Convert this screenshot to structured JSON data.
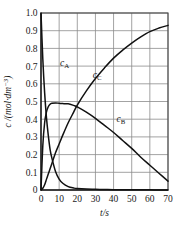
{
  "chart_data": {
    "type": "line",
    "title": "",
    "xlabel": "t/s",
    "ylabel": "c /(mol·dm⁻³)",
    "xlim": [
      0,
      70
    ],
    "ylim": [
      0,
      1.0
    ],
    "grid": true,
    "legend_position": "inline-curve-labels",
    "xticks": [
      "0",
      "10",
      "20",
      "30",
      "40",
      "50",
      "60",
      "70"
    ],
    "yticks": [
      "0",
      "0.1",
      "0.2",
      "0.3",
      "0.4",
      "0.5",
      "0.6",
      "0.7",
      "0.8",
      "0.9",
      "1.0"
    ],
    "x": [
      0,
      1,
      2,
      3,
      4,
      5,
      6,
      8,
      10,
      12,
      15,
      18,
      20,
      25,
      30,
      35,
      40,
      45,
      50,
      55,
      60,
      65,
      70
    ],
    "series": [
      {
        "name": "c_A",
        "label": "c",
        "sublabel": "A",
        "label_x": 13,
        "label_y": 0.7,
        "values": [
          1.0,
          0.74,
          0.55,
          0.41,
          0.31,
          0.23,
          0.18,
          0.105,
          0.062,
          0.038,
          0.019,
          0.011,
          0.008,
          0.005,
          0.004,
          0.003,
          0.002,
          0.002,
          0.001,
          0.001,
          0.001,
          0.0,
          0.0
        ]
      },
      {
        "name": "c_B",
        "label": "c",
        "sublabel": "B",
        "label_x": 44,
        "label_y": 0.385,
        "values": [
          0.0,
          0.25,
          0.38,
          0.44,
          0.47,
          0.485,
          0.49,
          0.492,
          0.49,
          0.488,
          0.487,
          0.478,
          0.47,
          0.44,
          0.405,
          0.365,
          0.325,
          0.28,
          0.235,
          0.185,
          0.14,
          0.095,
          0.05
        ]
      },
      {
        "name": "c_C",
        "label": "c",
        "sublabel": "C",
        "label_x": 31,
        "label_y": 0.635,
        "values": [
          0.0,
          0.01,
          0.03,
          0.06,
          0.09,
          0.12,
          0.15,
          0.21,
          0.26,
          0.31,
          0.38,
          0.44,
          0.48,
          0.56,
          0.63,
          0.69,
          0.745,
          0.79,
          0.83,
          0.865,
          0.895,
          0.915,
          0.93
        ]
      }
    ]
  },
  "colors": {
    "curve": "#111111",
    "grid": "#8c8c8c",
    "frame": "#4a4a4a",
    "background": "#ffffff"
  }
}
